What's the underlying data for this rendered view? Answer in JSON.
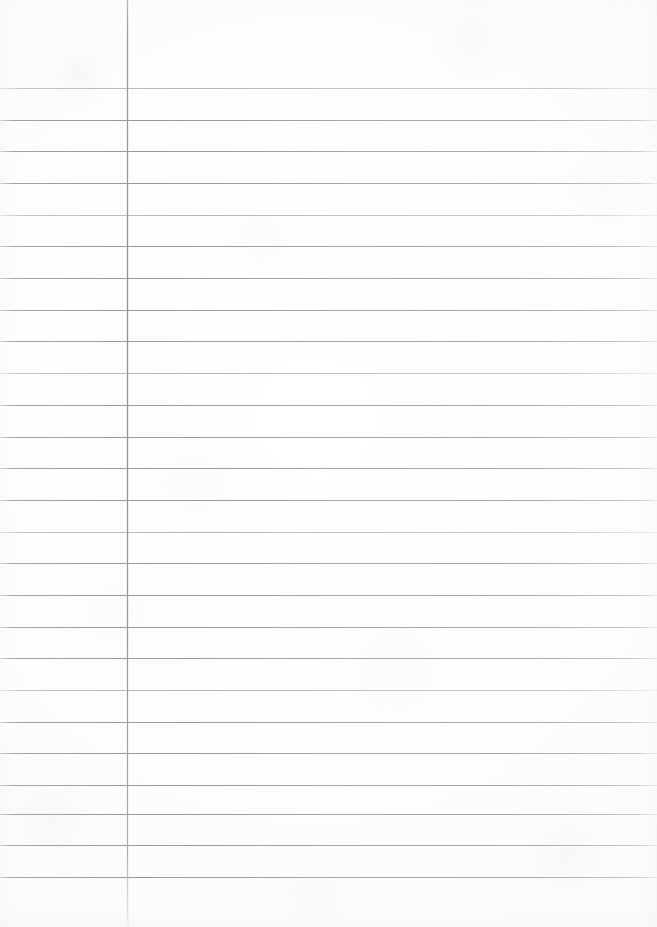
{
  "document": {
    "kind": "scanned-lined-paper",
    "title": "Blank Ruled Notebook Page",
    "page_width": 657,
    "page_height": 927,
    "orientation": "portrait",
    "content_text": "",
    "handwriting_present": "none",
    "printed_text_present": "none"
  },
  "paper": {
    "background_color": "#fdfdfd",
    "edge_shade_color": "#f4f4f6",
    "texture": "faint scanner mottling"
  },
  "ruling": {
    "style": "wide ruled with single left margin rule",
    "line_color": "#969aa3",
    "margin_rule_color": "#909199",
    "first_line_y": 88,
    "line_spacing": 31.6,
    "line_count": 26,
    "line_positions": [
      88,
      120,
      151,
      183,
      215,
      246,
      278,
      310,
      341,
      373,
      405,
      437,
      468,
      500,
      532,
      563,
      595,
      627,
      658,
      690,
      722,
      753,
      785,
      814,
      845,
      877
    ],
    "line_left_x": 0,
    "line_right_x": 657
  },
  "margin_rule": {
    "x": 127,
    "top_y": 0,
    "bottom_y": 921,
    "thickness": 1
  },
  "zones": {
    "header_label": "",
    "margin_column_label": "",
    "body_column_label": "",
    "footer_label": ""
  }
}
